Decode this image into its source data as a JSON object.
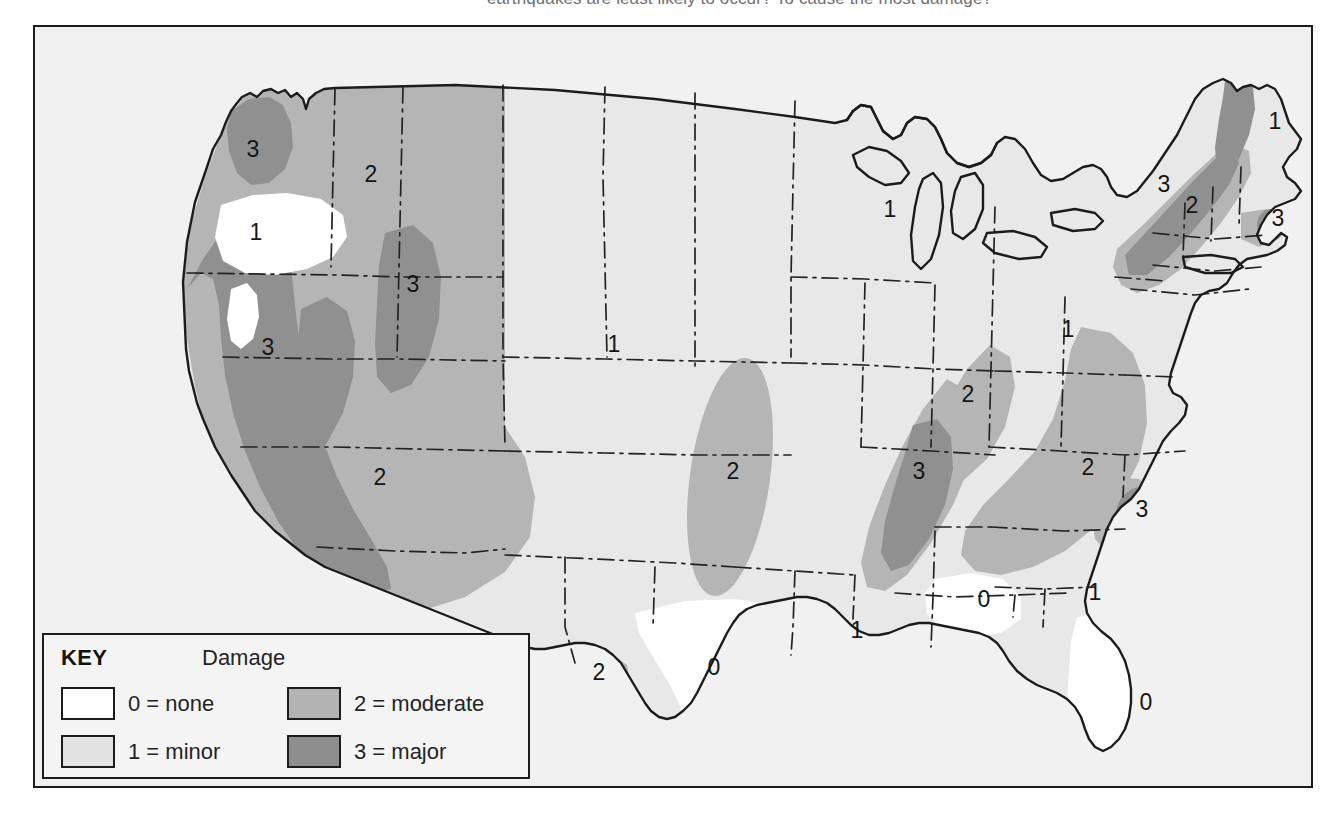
{
  "caption": {
    "text": "earthquakes are least likely to occur? To cause the most damage?"
  },
  "legend": {
    "title": "KEY",
    "heading": "Damage",
    "items": [
      {
        "level": "0",
        "label": "0 = none",
        "color": "#ffffff"
      },
      {
        "level": "1",
        "label": "1 = minor",
        "color": "#e2e2e2"
      },
      {
        "level": "2",
        "label": "2 = moderate",
        "color": "#b3b3b3"
      },
      {
        "level": "3",
        "label": "3 = major",
        "color": "#8e8e8e"
      }
    ]
  },
  "map": {
    "title": "United States earthquake damage risk map",
    "colors": {
      "level0": "#ffffff",
      "level1": "#e8e8e8",
      "level2": "#b5b5b5",
      "level3": "#909090",
      "outline": "#1c1c1c",
      "state_border": "#232323",
      "background": "#f1f1f1"
    },
    "zone_labels": [
      {
        "id": "pacific-northwest-coast",
        "value": "3",
        "x": 218,
        "y": 130
      },
      {
        "id": "idaho",
        "value": "2",
        "x": 336,
        "y": 155
      },
      {
        "id": "columbia-basin",
        "value": "1",
        "x": 221,
        "y": 213
      },
      {
        "id": "yellowstone",
        "value": "3",
        "x": 378,
        "y": 265
      },
      {
        "id": "california-nevada",
        "value": "3",
        "x": 233,
        "y": 328
      },
      {
        "id": "arizona-southwest",
        "value": "2",
        "x": 345,
        "y": 458
      },
      {
        "id": "montana-north",
        "value": "1",
        "x": 579,
        "y": 325
      },
      {
        "id": "nebraska-kansas",
        "value": "2",
        "x": 698,
        "y": 452
      },
      {
        "id": "texas-interior",
        "value": "0",
        "x": 679,
        "y": 648
      },
      {
        "id": "west-texas-rio-grande",
        "value": "2",
        "x": 564,
        "y": 653
      },
      {
        "id": "louisiana",
        "value": "1",
        "x": 822,
        "y": 611
      },
      {
        "id": "gulf-coast",
        "value": "0",
        "x": 949,
        "y": 580
      },
      {
        "id": "florida",
        "value": "0",
        "x": 1111,
        "y": 683
      },
      {
        "id": "georgia",
        "value": "1",
        "x": 1060,
        "y": 573
      },
      {
        "id": "new-madrid",
        "value": "3",
        "x": 884,
        "y": 452
      },
      {
        "id": "wabash-valley",
        "value": "2",
        "x": 933,
        "y": 375
      },
      {
        "id": "great-lakes",
        "value": "1",
        "x": 855,
        "y": 190
      },
      {
        "id": "ohio-valley",
        "value": "1",
        "x": 1033,
        "y": 310
      },
      {
        "id": "southern-appalachian",
        "value": "2",
        "x": 1053,
        "y": 448
      },
      {
        "id": "charleston-sc",
        "value": "3",
        "x": 1107,
        "y": 490
      },
      {
        "id": "hudson-valley",
        "value": "3",
        "x": 1129,
        "y": 165
      },
      {
        "id": "new-england-interior",
        "value": "2",
        "x": 1157,
        "y": 186
      },
      {
        "id": "cape-cod",
        "value": "3",
        "x": 1243,
        "y": 199
      },
      {
        "id": "maine",
        "value": "1",
        "x": 1240,
        "y": 102
      }
    ]
  }
}
